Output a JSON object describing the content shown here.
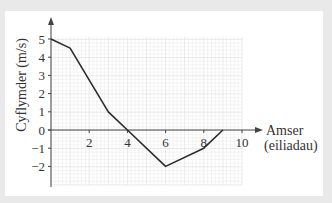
{
  "chart_data": {
    "type": "line",
    "title": "",
    "xlabel": "Amser (eiliadau)",
    "xlabel_lines": [
      "Amser",
      "(eiliadau)"
    ],
    "ylabel": "Cyflymder (m/s)",
    "x": [
      0,
      1,
      3,
      4,
      6,
      8,
      9
    ],
    "y": [
      5,
      4.5,
      1,
      0,
      -2,
      -1,
      0
    ],
    "series": [
      {
        "name": "Cyflymder",
        "x": [
          0,
          1,
          3,
          4,
          6,
          8,
          9
        ],
        "values": [
          5,
          4.5,
          1,
          0,
          -2,
          -1,
          0
        ]
      }
    ],
    "xticks": [
      "2",
      "4",
      "6",
      "8",
      "10"
    ],
    "yticks": [
      "5",
      "4",
      "3",
      "2",
      "1",
      "0",
      "−1",
      "−2"
    ],
    "xlim": [
      0,
      10
    ],
    "ylim": [
      -2.9,
      5
    ],
    "grid": true,
    "legend": null
  },
  "colors": {
    "line": "#2b2b2b",
    "axis": "#444444",
    "grid_minor": "#ececec",
    "grid_major": "#dcdcdc",
    "background": "#e9e9e9",
    "panel": "#ffffff"
  }
}
